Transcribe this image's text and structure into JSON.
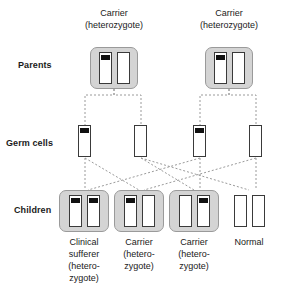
{
  "diagram": {
    "colors": {
      "cell_fill": "#d4d4d4",
      "cell_border": "#9a9a9a",
      "chromosome_fill": "#ffffff",
      "chromosome_border": "#3a3a3a",
      "mutation_band": "#111111",
      "connector": "#9a9a9a",
      "text": "#1a1a1a",
      "background": "#ffffff"
    }
  },
  "rows": [
    {
      "id": "parents",
      "label": "Parents"
    },
    {
      "id": "germ_cells",
      "label": "Germ cells"
    },
    {
      "id": "children",
      "label": "Children"
    }
  ],
  "parents": [
    {
      "id": "parent-left",
      "caption_lines": [
        "Carrier",
        "(heterozygote)"
      ],
      "genotype": "heterozygote",
      "chromosomes": [
        {
          "name": "affected-allele",
          "has_band": true
        },
        {
          "name": "normal-allele",
          "has_band": false
        }
      ]
    },
    {
      "id": "parent-right",
      "caption_lines": [
        "Carrier",
        "(heterozygote)"
      ],
      "genotype": "heterozygote",
      "chromosomes": [
        {
          "name": "affected-allele",
          "has_band": true
        },
        {
          "name": "normal-allele",
          "has_band": false
        }
      ]
    }
  ],
  "germ_cells": [
    {
      "id": "germ-cell-1",
      "from_parent": "parent-left",
      "has_band": true
    },
    {
      "id": "germ-cell-2",
      "from_parent": "parent-left",
      "has_band": false
    },
    {
      "id": "germ-cell-3",
      "from_parent": "parent-right",
      "has_band": true
    },
    {
      "id": "germ-cell-4",
      "from_parent": "parent-right",
      "has_band": false
    }
  ],
  "children": [
    {
      "id": "child-1",
      "caption_lines": [
        "Clinical",
        "sufferer",
        "(hetero-",
        "zygote)"
      ],
      "outcome": "clinical sufferer",
      "has_cell_box": true,
      "chromosomes": [
        {
          "name": "affected-allele",
          "has_band": true
        },
        {
          "name": "affected-allele",
          "has_band": true
        }
      ]
    },
    {
      "id": "child-2",
      "caption_lines": [
        "Carrier",
        "(hetero-",
        "zygote)"
      ],
      "outcome": "carrier",
      "has_cell_box": true,
      "chromosomes": [
        {
          "name": "affected-allele",
          "has_band": true
        },
        {
          "name": "normal-allele",
          "has_band": false
        }
      ]
    },
    {
      "id": "child-3",
      "caption_lines": [
        "Carrier",
        "(hetero-",
        "zygote)"
      ],
      "outcome": "carrier",
      "has_cell_box": true,
      "chromosomes": [
        {
          "name": "normal-allele",
          "has_band": false
        },
        {
          "name": "affected-allele",
          "has_band": true
        }
      ]
    },
    {
      "id": "child-4",
      "caption_lines": [
        "Normal"
      ],
      "outcome": "normal",
      "has_cell_box": false,
      "chromosomes": [
        {
          "name": "normal-allele",
          "has_band": false
        },
        {
          "name": "normal-allele",
          "has_band": false
        }
      ]
    }
  ]
}
